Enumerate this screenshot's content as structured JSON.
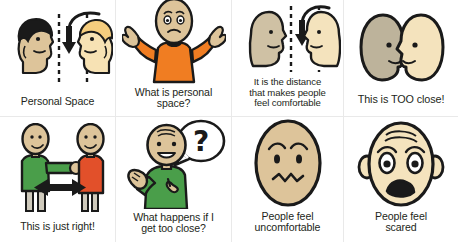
{
  "board": {
    "title": "Personal Space visual support cards",
    "rows": 2,
    "columns": 4
  },
  "palette": {
    "outline": "#1a1a1a",
    "text": "#231f20",
    "grid_line": "#e9e9e9",
    "background": "#ffffff",
    "skin_light": "#f7dfb0",
    "skin_cream": "#f4e3bd",
    "skin_tan": "#ddcba0",
    "skin_grey": "#bdb39b",
    "hair_dark": "#1a1a1a",
    "hair_blonde": "#f0c97a",
    "shirt_orange": "#f07d22",
    "shirt_green": "#4a9e4a",
    "shirt_red": "#e2502a",
    "pants_grey": "#cfcabc"
  },
  "cards": [
    {
      "id": "personal-space",
      "caption": "Personal Space",
      "art": "two-profiles-arrow-dashed-lines",
      "position": {
        "row": 1,
        "col": 1
      }
    },
    {
      "id": "what-is-personal-space",
      "caption": "What is personal\nspace?",
      "art": "shrugging-person-orange-shirt",
      "position": {
        "row": 1,
        "col": 2
      }
    },
    {
      "id": "it-is-the-distance",
      "caption": "It is the distance\nthat makes people\nfeel comfortable",
      "art": "two-profiles-arrow-dashed-lines",
      "position": {
        "row": 1,
        "col": 3
      }
    },
    {
      "id": "too-close",
      "caption": "This is TOO close!",
      "art": "two-egg-heads-touching",
      "position": {
        "row": 1,
        "col": 4
      }
    },
    {
      "id": "just-right",
      "caption": "This is just right!",
      "art": "two-people-double-arrow",
      "position": {
        "row": 2,
        "col": 1
      }
    },
    {
      "id": "what-happens-if-too-close",
      "caption": "What happens if I\nget too close?",
      "art": "person-question-bubble",
      "position": {
        "row": 2,
        "col": 2
      }
    },
    {
      "id": "people-feel-uncomfortable",
      "caption": "People feel\nuncomfortable",
      "art": "uncomfortable-face",
      "position": {
        "row": 2,
        "col": 3
      }
    },
    {
      "id": "people-feel-scared",
      "caption": "People feel\nscared",
      "art": "scared-face",
      "position": {
        "row": 2,
        "col": 4
      }
    }
  ]
}
